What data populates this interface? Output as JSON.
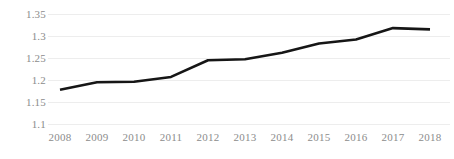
{
  "chart_data": {
    "type": "line",
    "title": "",
    "subtitle": "",
    "xlabel": "",
    "ylabel": "",
    "categories": [
      "2008",
      "2009",
      "2010",
      "2011",
      "2012",
      "2013",
      "2014",
      "2015",
      "2016",
      "2017",
      "2018"
    ],
    "x": [
      2008,
      2009,
      2010,
      2011,
      2012,
      2013,
      2014,
      2015,
      2016,
      2017,
      2018
    ],
    "values": [
      1.178,
      1.195,
      1.196,
      1.207,
      1.245,
      1.247,
      1.262,
      1.283,
      1.292,
      1.318,
      1.315
    ],
    "series": [
      {
        "name": "",
        "values": [
          1.178,
          1.195,
          1.196,
          1.207,
          1.245,
          1.247,
          1.262,
          1.283,
          1.292,
          1.318,
          1.315
        ]
      }
    ],
    "ylim": [
      1.1,
      1.35
    ],
    "ytick_labels": [
      "1.35",
      "1.3",
      "1.25",
      "1.2",
      "1.15",
      "1.1"
    ],
    "ytick_values": [
      1.35,
      1.3,
      1.25,
      1.2,
      1.15,
      1.1
    ],
    "xtick_labels": [
      "2008",
      "2009",
      "2010",
      "2011",
      "2012",
      "2013",
      "2014",
      "2015",
      "2016",
      "2017",
      "2018"
    ],
    "grid": "horizontal",
    "legend": "none",
    "annotations": [],
    "colors": {
      "line": "#161616",
      "grid": "#ededed",
      "tick_label": "#8c8c8c",
      "background": "#ffffff"
    }
  }
}
